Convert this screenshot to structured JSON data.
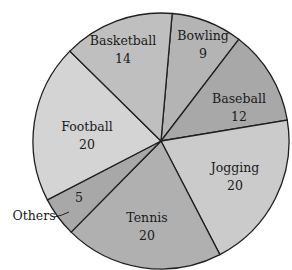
{
  "chart_data": {
    "type": "pie",
    "title": "",
    "total": 100,
    "start_angle_deg": 5,
    "center": [
      161,
      141
    ],
    "radius": 128,
    "slices": [
      {
        "label": "Bowling",
        "value": 9,
        "color": "#b4b4b4",
        "label_pos": [
          203,
          40
        ],
        "value_pos": [
          203,
          58
        ]
      },
      {
        "label": "Baseball",
        "value": 12,
        "color": "#a8a8a8",
        "label_pos": [
          239,
          103
        ],
        "value_pos": [
          239,
          121
        ]
      },
      {
        "label": "Jogging",
        "value": 20,
        "color": "#cbcbcb",
        "label_pos": [
          235,
          172
        ],
        "value_pos": [
          235,
          190
        ]
      },
      {
        "label": "Tennis",
        "value": 20,
        "color": "#b0b0b0",
        "label_pos": [
          147,
          222
        ],
        "value_pos": [
          147,
          240
        ]
      },
      {
        "label": "Others",
        "value": 5,
        "color": "#a8a8a8",
        "label_pos": null,
        "value_pos": [
          79,
          202
        ]
      },
      {
        "label": "Football",
        "value": 20,
        "color": "#d4d4d4",
        "label_pos": [
          87,
          131
        ],
        "value_pos": [
          87,
          149
        ]
      },
      {
        "label": "Basketball",
        "value": 14,
        "color": "#bfbfbf",
        "label_pos": [
          123,
          45
        ],
        "value_pos": [
          123,
          63
        ]
      }
    ],
    "external_labels": [
      {
        "label": "Others",
        "pos": [
          34,
          220
        ],
        "leader_to": [
          69,
          212
        ]
      }
    ]
  }
}
